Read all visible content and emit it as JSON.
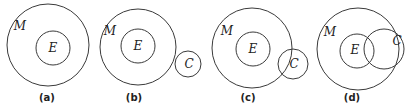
{
  "figure": {
    "panels": [
      {
        "id": "a",
        "caption": "(a)",
        "caption_pos": [
          47,
          101
        ],
        "circles": [
          {
            "name": "M",
            "cx": 48,
            "cy": 45,
            "r": 41,
            "label": "M",
            "label_pos": [
              20,
              30
            ]
          },
          {
            "name": "E",
            "cx": 53,
            "cy": 48,
            "r": 17,
            "label": "E",
            "label_pos": [
              53,
              52
            ]
          }
        ]
      },
      {
        "id": "b",
        "caption": "(b)",
        "caption_pos": [
          134,
          101
        ],
        "circles": [
          {
            "name": "M",
            "cx": 138,
            "cy": 47,
            "r": 38,
            "label": "M",
            "label_pos": [
              110,
              35
            ]
          },
          {
            "name": "E",
            "cx": 138,
            "cy": 46,
            "r": 17,
            "label": "E",
            "label_pos": [
              138,
              50
            ]
          },
          {
            "name": "C",
            "cx": 188,
            "cy": 64,
            "r": 13,
            "label": "C",
            "label_pos": [
              189,
              68
            ]
          }
        ]
      },
      {
        "id": "c",
        "caption": "(c)",
        "caption_pos": [
          248,
          101
        ],
        "circles": [
          {
            "name": "M",
            "cx": 252,
            "cy": 48,
            "r": 40,
            "label": "M",
            "label_pos": [
              227,
              35
            ]
          },
          {
            "name": "E",
            "cx": 253,
            "cy": 49,
            "r": 17,
            "label": "E",
            "label_pos": [
              253,
              53
            ]
          },
          {
            "name": "C",
            "cx": 293,
            "cy": 64,
            "r": 15,
            "label": "C",
            "label_pos": [
              294,
              68
            ]
          }
        ]
      },
      {
        "id": "d",
        "caption": "(d)",
        "caption_pos": [
          352,
          101
        ],
        "circles": [
          {
            "name": "M",
            "cx": 358,
            "cy": 49,
            "r": 41,
            "label": "M",
            "label_pos": [
              330,
              36
            ]
          },
          {
            "name": "E",
            "cx": 357,
            "cy": 51,
            "r": 17,
            "label": "E",
            "label_pos": [
              355,
              54
            ]
          },
          {
            "name": "C",
            "cx": 384,
            "cy": 49,
            "r": 20,
            "label": "C",
            "label_pos": [
              397,
              45
            ]
          }
        ]
      }
    ]
  }
}
